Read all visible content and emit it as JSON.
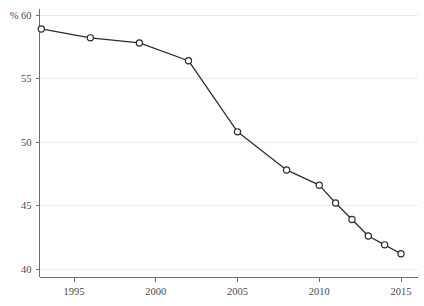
{
  "chart_data": {
    "type": "line",
    "title": "",
    "subtitle": "",
    "xlabel": "",
    "ylabel": "",
    "unit_label": "% 60",
    "unit_symbol": "%",
    "grid": true,
    "legend": false,
    "legend_position": "none",
    "xlim": [
      1992.2,
      2015.8
    ],
    "ylim": [
      39.2,
      60.4
    ],
    "xticks": [
      1995,
      2000,
      2005,
      2010,
      2015
    ],
    "xtick_labels": [
      "1995",
      "2000",
      "2005",
      "2010",
      "2015"
    ],
    "yticks": [
      40,
      45,
      50,
      55,
      60
    ],
    "ytick_labels": [
      "40",
      "45",
      "50",
      "55",
      "60"
    ],
    "top_ytick_label": "60",
    "series": [
      {
        "name": "series-1",
        "color": "#2b2b2f",
        "marker": "open-circle",
        "x": [
          1993,
          1996,
          1999,
          2002,
          2005,
          2008,
          2010,
          2011,
          2012,
          2013,
          2014,
          2015
        ],
        "values": [
          58.9,
          58.2,
          57.8,
          56.4,
          50.8,
          47.8,
          46.6,
          45.2,
          43.9,
          42.6,
          41.9,
          41.2
        ],
        "points": [
          {
            "x": 1993,
            "y": 58.9
          },
          {
            "x": 1996,
            "y": 58.2
          },
          {
            "x": 1999,
            "y": 57.8
          },
          {
            "x": 2002,
            "y": 56.4
          },
          {
            "x": 2005,
            "y": 50.8
          },
          {
            "x": 2008,
            "y": 47.8
          },
          {
            "x": 2010,
            "y": 46.6
          },
          {
            "x": 2011,
            "y": 45.2
          },
          {
            "x": 2012,
            "y": 43.9
          },
          {
            "x": 2013,
            "y": 42.6
          },
          {
            "x": 2014,
            "y": 41.9
          },
          {
            "x": 2015,
            "y": 41.2
          }
        ]
      }
    ],
    "colors": {
      "line": "#2b2b2f",
      "marker_fill": "#ffffff",
      "grid": "#eceaee",
      "axis": "#6e6e72",
      "text": "#4a4a4e",
      "background": "#ffffff"
    }
  }
}
